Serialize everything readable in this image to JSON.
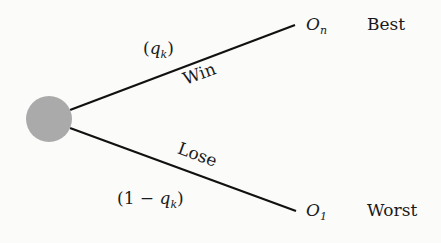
{
  "diagram": {
    "type": "decision-tree-chance-node",
    "node": {
      "shape": "circle",
      "color": "#aaaaaa"
    },
    "branches": [
      {
        "name": "Win",
        "probability": "(q_k)",
        "outcome": "O_n",
        "outcome_label": "Best"
      },
      {
        "name": "Lose",
        "probability": "(1 − q_k)",
        "outcome": "O_1",
        "outcome_label": "Worst"
      }
    ]
  },
  "labels": {
    "win": "Win",
    "lose": "Lose",
    "prob_win_open": "(",
    "prob_win_var": "q",
    "prob_win_sub": "k",
    "prob_win_close": ")",
    "prob_lose_prefix": "(1 − ",
    "prob_lose_var": "q",
    "prob_lose_sub": "k",
    "prob_lose_close": ")",
    "outcome_top_var": "O",
    "outcome_top_sub": "n",
    "outcome_top_label": "Best",
    "outcome_bottom_var": "O",
    "outcome_bottom_sub": "1",
    "outcome_bottom_label": "Worst"
  }
}
